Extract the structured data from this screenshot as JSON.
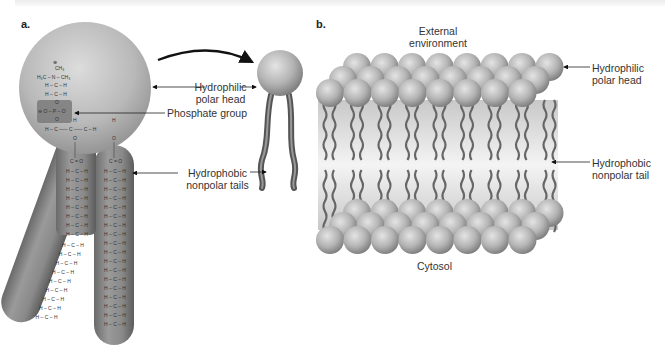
{
  "figure": {
    "panel_a": {
      "letter": "a.",
      "labels": {
        "polar_head_line1": "Hydrophilic",
        "polar_head_line2": "polar head",
        "phosphate": "Phosphate group",
        "tails_line1": "Hydrophobic",
        "tails_line2": "nonpolar tails"
      },
      "chemistry": {
        "charge_pos": "⊕",
        "ch3_top": "CH₃",
        "amine_row": "H₃C – N – CH₃",
        "ch2_row": "H – C – H",
        "phosphate_row": "⊖ O – P – O",
        "glycerol_row": "H – C ––– C ––– C – H",
        "carbonyl": "C = O",
        "chain_unit": "H – C – H",
        "oxygen": "O",
        "hydrogen": "H"
      }
    },
    "panel_b": {
      "letter": "b.",
      "labels": {
        "external_line1": "External",
        "external_line2": "environment",
        "cytosol": "Cytosol",
        "polar_head_line1": "Hydrophilic",
        "polar_head_line2": "polar head",
        "tail_line1": "Hydrophobic",
        "tail_line2": "nonpolar tail"
      }
    },
    "colors": {
      "head_light": "#d8d8d8",
      "head_dark": "#8a8a8a",
      "tail": "#6a6a6a",
      "phosphate_box": "#7a7a7a",
      "membrane_core": "#e4e4e4",
      "text": "#333333"
    }
  }
}
